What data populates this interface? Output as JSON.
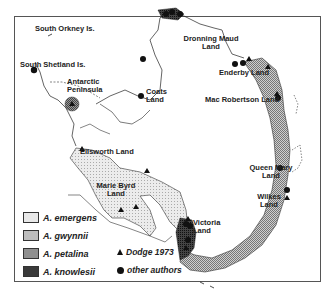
{
  "map": {
    "title": "Distribution of Antarctic lichen species",
    "labels": {
      "south_orkney": "South Orkney Is.",
      "south_shetland": "South Shetland Is.",
      "antarctic_peninsula_1": "Antarctic",
      "antarctic_peninsula_2": "Peninsula",
      "coats_1": "Coats",
      "coats_2": "Land",
      "dronning_1": "Dronning Maud",
      "dronning_2": "Land",
      "enderby": "Enderby Land",
      "mac_robertson": "Mac Robertson Land",
      "ellsworth": "Ellsworth Land",
      "marie_byrd_1": "Marie Byrd",
      "marie_byrd_2": "Land",
      "queen_mary_1": "Queen Mary",
      "queen_mary_2": "Land",
      "wilkes_1": "Wilkes",
      "wilkes_2": "Land",
      "victoria_1": "Victoria",
      "victoria_2": "Land"
    }
  },
  "legend": {
    "species": [
      {
        "name": "A. emergens",
        "pattern": "light-dotted",
        "color": "#e4e4e4"
      },
      {
        "name": "A. gwynnii",
        "pattern": "medium-stipple",
        "color": "#b8b8b8"
      },
      {
        "name": "A. petalina",
        "pattern": "dense-stipple",
        "color": "#8a8a8a"
      },
      {
        "name": "A. knowlesii",
        "pattern": "dark-solid",
        "color": "#3a3a3a"
      }
    ],
    "symbols": [
      {
        "icon": "triangle-icon",
        "label": "Dodge 1973"
      },
      {
        "icon": "circle-icon",
        "label": "other authors"
      }
    ]
  }
}
